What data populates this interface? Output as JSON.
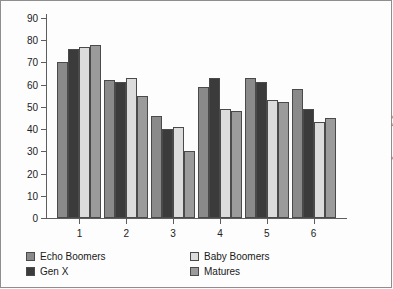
{
  "chart_data": {
    "type": "bar",
    "title": "",
    "subtitle": "",
    "xlabel": "",
    "ylabel": "",
    "categories": [
      "1",
      "2",
      "3",
      "4",
      "5",
      "6"
    ],
    "ylim": [
      0,
      90
    ],
    "yticks": [
      0,
      10,
      20,
      30,
      40,
      50,
      60,
      70,
      80,
      90
    ],
    "grid": false,
    "legend_position": "bottom",
    "series": [
      {
        "name": "Echo Boomers",
        "color": "#8a8a8a",
        "values": [
          70,
          62,
          46,
          59,
          63,
          58
        ]
      },
      {
        "name": "Gen X",
        "color": "#3b3b3b",
        "values": [
          76,
          61,
          40,
          63,
          61,
          49
        ]
      },
      {
        "name": "Baby Boomers",
        "color": "#dcdcdc",
        "values": [
          77,
          63,
          41,
          49,
          53,
          43
        ]
      },
      {
        "name": "Matures",
        "color": "#9b9b9b",
        "values": [
          78,
          55,
          30,
          48,
          52,
          45
        ]
      }
    ]
  },
  "legend": {
    "items": [
      {
        "label": "Echo Boomers"
      },
      {
        "label": "Baby Boomers"
      },
      {
        "label": "Gen X"
      },
      {
        "label": "Matures"
      }
    ]
  },
  "footer": {
    "copyright": "© 2016 Cengage Learning®"
  }
}
